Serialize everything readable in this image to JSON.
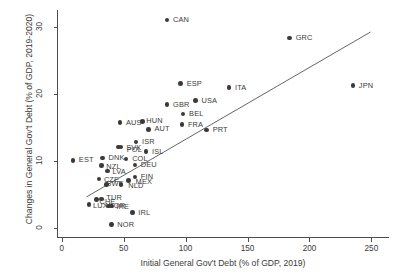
{
  "chart_data": {
    "type": "scatter",
    "title": "",
    "xlabel": "Initial General Gov't Debt (% of GDP, 2019)",
    "ylabel": "Changes in General Gov't Debt (% of GDP, 2019-2020)",
    "xlim": [
      -3,
      265
    ],
    "ylim": [
      -1.5,
      32.5
    ],
    "xticks": [
      0,
      50,
      100,
      150,
      200,
      250
    ],
    "yticks": [
      0,
      10,
      20,
      30
    ],
    "grid": false,
    "legend": null,
    "marker_color": "#3a3a3a",
    "trendline_color": "#555555",
    "trendline": {
      "x": [
        20,
        250
      ],
      "y": [
        4.5,
        29.2
      ]
    },
    "points": [
      {
        "label": "CAN",
        "x": 85,
        "y": 31.0,
        "lx": 6,
        "ly": 0
      },
      {
        "label": "GRC",
        "x": 184,
        "y": 28.3,
        "lx": 6,
        "ly": 0
      },
      {
        "label": "ESP",
        "x": 96,
        "y": 21.5,
        "lx": 6,
        "ly": 0
      },
      {
        "label": "ITA",
        "x": 135,
        "y": 20.9,
        "lx": 6,
        "ly": 0
      },
      {
        "label": "JPN",
        "x": 235,
        "y": 21.2,
        "lx": 6,
        "ly": 0
      },
      {
        "label": "GBR",
        "x": 85,
        "y": 18.4,
        "lx": 6,
        "ly": 0
      },
      {
        "label": "USA",
        "x": 108,
        "y": 19.0,
        "lx": 6,
        "ly": 0
      },
      {
        "label": "BEL",
        "x": 98,
        "y": 17.0,
        "lx": 6,
        "ly": 0
      },
      {
        "label": "AUS",
        "x": 47,
        "y": 15.7,
        "lx": 6,
        "ly": 0
      },
      {
        "label": "HUN",
        "x": 65,
        "y": 15.9,
        "lx": 4,
        "ly": 0
      },
      {
        "label": "FRA",
        "x": 97,
        "y": 15.4,
        "lx": 6,
        "ly": 0
      },
      {
        "label": "AUT",
        "x": 70,
        "y": 14.7,
        "lx": 6,
        "ly": 0
      },
      {
        "label": "PRT",
        "x": 117,
        "y": 14.6,
        "lx": 6,
        "ly": 0
      },
      {
        "label": "ISR",
        "x": 60,
        "y": 12.8,
        "lx": 6,
        "ly": 0
      },
      {
        "label": "SVK",
        "x": 48,
        "y": 12.1,
        "lx": 5,
        "ly": 1
      },
      {
        "label": "POL",
        "x": 46,
        "y": 12.1,
        "lx": 8,
        "ly": 3
      },
      {
        "label": "ISL",
        "x": 68,
        "y": 11.4,
        "lx": 6,
        "ly": 1
      },
      {
        "label": "EST",
        "x": 9,
        "y": 10.1,
        "lx": 6,
        "ly": 0
      },
      {
        "label": "DNK",
        "x": 33,
        "y": 10.4,
        "lx": 6,
        "ly": 0
      },
      {
        "label": "COL",
        "x": 52,
        "y": 10.3,
        "lx": 6,
        "ly": 0
      },
      {
        "label": "NZL",
        "x": 32,
        "y": 9.3,
        "lx": 5,
        "ly": 1
      },
      {
        "label": "DEU",
        "x": 59,
        "y": 9.4,
        "lx": 6,
        "ly": 0
      },
      {
        "label": "LVA",
        "x": 37,
        "y": 8.5,
        "lx": 5,
        "ly": 1
      },
      {
        "label": "CZE",
        "x": 30,
        "y": 7.3,
        "lx": 5,
        "ly": 1
      },
      {
        "label": "FIN",
        "x": 59,
        "y": 7.6,
        "lx": 6,
        "ly": 0
      },
      {
        "label": "MEX",
        "x": 54,
        "y": 7.1,
        "lx": 7,
        "ly": 2
      },
      {
        "label": "NLD",
        "x": 48,
        "y": 6.5,
        "lx": 7,
        "ly": 2
      },
      {
        "label": "SWE",
        "x": 36,
        "y": 6.5,
        "lx": 0,
        "ly": 0
      },
      {
        "label": "TUR",
        "x": 32,
        "y": 4.3,
        "lx": 5,
        "ly": -1
      },
      {
        "label": "CHE",
        "x": 28,
        "y": 4.2,
        "lx": 3,
        "ly": 2
      },
      {
        "label": "LUX",
        "x": 22,
        "y": 3.5,
        "lx": 4,
        "ly": 2
      },
      {
        "label": "IRE",
        "x": 40,
        "y": 3.3,
        "lx": 5,
        "ly": 1
      },
      {
        "label": "KOR",
        "x": 38,
        "y": 3.3,
        "lx": 0,
        "ly": 0
      },
      {
        "label": "IRL",
        "x": 57,
        "y": 2.3,
        "lx": 6,
        "ly": 0
      },
      {
        "label": "NOR",
        "x": 40,
        "y": 0.5,
        "lx": 6,
        "ly": 0
      }
    ]
  }
}
